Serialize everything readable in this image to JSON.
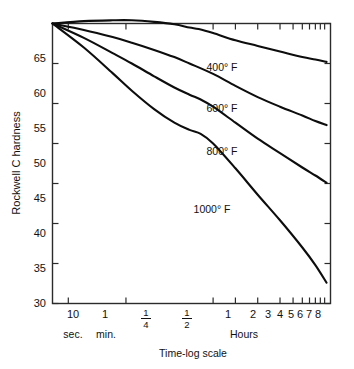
{
  "chart_data": {
    "type": "line",
    "title": "",
    "subtitle": "",
    "xlabel": "Time-log scale",
    "ylabel": "Rockwell C hardness",
    "x_units_label": "Hours",
    "x_left_unit_labels": [
      "sec.",
      "min."
    ],
    "xscale": "log",
    "xlim": [
      5,
      10
    ],
    "ylim": [
      30,
      65
    ],
    "grid": false,
    "legend": "inline-labels",
    "x_tick_labels": [
      "10",
      "1",
      "¼",
      "½",
      "1",
      "2",
      "3",
      "4",
      "5",
      "6",
      "7",
      "8"
    ],
    "x_tick_hours": [
      0.002778,
      0.016667,
      0.25,
      0.5,
      1,
      2,
      3,
      4,
      5,
      6,
      7,
      8
    ],
    "y_tick_labels": [
      "30",
      "35",
      "40",
      "45",
      "50",
      "55",
      "60",
      "65"
    ],
    "y_ticks": [
      30,
      35,
      40,
      45,
      50,
      55,
      60,
      65
    ],
    "series": [
      {
        "name": "400° F",
        "label": "400° F",
        "color": "#0d0d0d",
        "points": [
          [
            0.0017,
            65.0
          ],
          [
            0.0045,
            65.3
          ],
          [
            0.011,
            65.4
          ],
          [
            0.02,
            65.4
          ],
          [
            0.04,
            65.2
          ],
          [
            0.075,
            64.9
          ],
          [
            0.12,
            64.5
          ],
          [
            0.16,
            64.3
          ],
          [
            0.25,
            63.8
          ],
          [
            0.5,
            62.9
          ],
          [
            1.0,
            62.2
          ],
          [
            2.0,
            61.5
          ],
          [
            4.0,
            60.8
          ],
          [
            6.0,
            60.5
          ],
          [
            8.5,
            60.2
          ]
        ]
      },
      {
        "name": "600° F",
        "label": "600° F",
        "color": "#0d0d0d",
        "points": [
          [
            0.0017,
            65.0
          ],
          [
            0.0045,
            64.2
          ],
          [
            0.011,
            63.3
          ],
          [
            0.02,
            62.6
          ],
          [
            0.04,
            61.7
          ],
          [
            0.075,
            60.8
          ],
          [
            0.12,
            60.0
          ],
          [
            0.25,
            58.7
          ],
          [
            0.5,
            57.2
          ],
          [
            1.0,
            55.8
          ],
          [
            2.0,
            54.6
          ],
          [
            4.0,
            53.5
          ],
          [
            6.0,
            52.8
          ],
          [
            8.5,
            52.3
          ]
        ]
      },
      {
        "name": "800° F",
        "label": "800° F",
        "color": "#0d0d0d",
        "points": [
          [
            0.0017,
            65.0
          ],
          [
            0.0045,
            63.2
          ],
          [
            0.011,
            61.3
          ],
          [
            0.02,
            60.0
          ],
          [
            0.04,
            58.4
          ],
          [
            0.075,
            57.0
          ],
          [
            0.12,
            56.1
          ],
          [
            0.17,
            55.5
          ],
          [
            0.25,
            54.6
          ],
          [
            0.5,
            52.6
          ],
          [
            1.0,
            50.6
          ],
          [
            2.0,
            48.8
          ],
          [
            4.0,
            47.0
          ],
          [
            6.0,
            46.0
          ],
          [
            8.5,
            45.1
          ]
        ]
      },
      {
        "name": "1000° F",
        "label": "1000° F",
        "color": "#0d0d0d",
        "points": [
          [
            0.0017,
            65.0
          ],
          [
            0.0045,
            62.0
          ],
          [
            0.011,
            58.8
          ],
          [
            0.02,
            56.6
          ],
          [
            0.04,
            54.3
          ],
          [
            0.075,
            52.6
          ],
          [
            0.12,
            51.7
          ],
          [
            0.17,
            51.2
          ],
          [
            0.25,
            50.0
          ],
          [
            0.5,
            46.9
          ],
          [
            1.0,
            43.6
          ],
          [
            2.0,
            40.4
          ],
          [
            4.0,
            37.0
          ],
          [
            6.0,
            34.8
          ],
          [
            8.5,
            32.6
          ]
        ]
      }
    ]
  },
  "labels": {
    "series_400": "400° F",
    "series_600": "600° F",
    "series_800": "800° F",
    "series_1000": "1000° F",
    "y_axis_title": "Rockwell C hardness",
    "x_axis_title": "Time-log scale",
    "hours_caption": "Hours",
    "sec_caption": "sec.",
    "min_caption": "min.",
    "tick_y_30": "30",
    "tick_y_35": "35",
    "tick_y_40": "40",
    "tick_y_45": "45",
    "tick_y_50": "50",
    "tick_y_55": "55",
    "tick_y_60": "60",
    "tick_y_65": "65",
    "tick_x_10sec": "10",
    "tick_x_1min": "1",
    "tick_x_quarter_num": "1",
    "tick_x_quarter_den": "4",
    "tick_x_half_num": "1",
    "tick_x_half_den": "2",
    "tick_x_1": "1",
    "tick_x_2": "2",
    "tick_x_3": "3",
    "tick_x_4": "4",
    "tick_x_5": "5",
    "tick_x_6": "6",
    "tick_x_7": "7",
    "tick_x_8": "8"
  }
}
